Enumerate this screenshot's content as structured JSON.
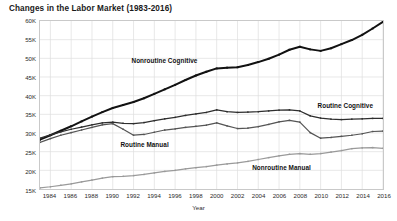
{
  "chart_data": {
    "type": "line",
    "title": "Changes in the Labor Market (1983-2016)",
    "xlabel": "Year",
    "ylabel": "Employment (Thousands)",
    "xlim": [
      1983,
      2016
    ],
    "ylim": [
      15000,
      60000
    ],
    "grid": true,
    "legend_position": "inline-annotations",
    "y_tick_labels": [
      "60K",
      "55K",
      "50K",
      "45K",
      "40K",
      "35K",
      "30K",
      "25K",
      "20K",
      "15K"
    ],
    "y_tick_values": [
      60000,
      55000,
      50000,
      45000,
      40000,
      35000,
      30000,
      25000,
      20000,
      15000
    ],
    "x_tick_labels": [
      "1984",
      "1986",
      "1988",
      "1990",
      "1992",
      "1994",
      "1996",
      "1998",
      "2000",
      "2002",
      "2004",
      "2006",
      "2008",
      "2010",
      "2012",
      "2014",
      "2016"
    ],
    "x_tick_values": [
      1984,
      1986,
      1988,
      1990,
      1992,
      1994,
      1996,
      1998,
      2000,
      2002,
      2004,
      2006,
      2008,
      2010,
      2012,
      2014,
      2016
    ],
    "x": [
      1983,
      1984,
      1985,
      1986,
      1987,
      1988,
      1989,
      1990,
      1991,
      1992,
      1993,
      1994,
      1995,
      1996,
      1997,
      1998,
      1999,
      2000,
      2001,
      2002,
      2003,
      2004,
      2005,
      2006,
      2007,
      2008,
      2009,
      2010,
      2011,
      2012,
      2013,
      2014,
      2015,
      2016
    ],
    "series": [
      {
        "name": "Nonroutine Cognitive",
        "color": "#121212",
        "values": [
          28200,
          29400,
          30600,
          31800,
          33100,
          34400,
          35600,
          36700,
          37500,
          38300,
          39300,
          40500,
          41700,
          42900,
          44200,
          45400,
          46400,
          47300,
          47500,
          47600,
          48200,
          49000,
          49900,
          51000,
          52300,
          53100,
          52400,
          52000,
          52700,
          53800,
          54900,
          56300,
          58000,
          59800
        ]
      },
      {
        "name": "Routine Cognitive",
        "color": "#2e2e2e",
        "values": [
          28600,
          29500,
          30300,
          31000,
          31600,
          32200,
          32700,
          32900,
          32600,
          32500,
          32800,
          33300,
          33800,
          34200,
          34700,
          35100,
          35500,
          36200,
          35700,
          35500,
          35600,
          35700,
          35900,
          36100,
          36200,
          35900,
          34600,
          34000,
          33700,
          33600,
          33700,
          33800,
          33900,
          33900
        ]
      },
      {
        "name": "Routine Manual",
        "color": "#555555",
        "values": [
          27500,
          28500,
          29400,
          30100,
          30800,
          31500,
          32200,
          32500,
          31000,
          29400,
          29600,
          30200,
          30800,
          31100,
          31500,
          31800,
          32100,
          32700,
          31900,
          31200,
          31300,
          31700,
          32300,
          33000,
          33400,
          32900,
          30100,
          28600,
          28800,
          29100,
          29400,
          29800,
          30400,
          30500
        ]
      },
      {
        "name": "Nonroutine Manual",
        "color": "#9a9a9a",
        "values": [
          15300,
          15600,
          16000,
          16400,
          16900,
          17400,
          17900,
          18300,
          18400,
          18600,
          18900,
          19300,
          19700,
          20000,
          20400,
          20700,
          21000,
          21400,
          21700,
          22000,
          22400,
          22900,
          23400,
          23900,
          24300,
          24500,
          24300,
          24500,
          24900,
          25300,
          25800,
          26000,
          26100,
          25900
        ]
      }
    ],
    "annotations": [
      {
        "label": "Nonroutine Cognitive",
        "x": 1995.0,
        "y": 49500
      },
      {
        "label": "Routine Cognitive",
        "x": 2012.3,
        "y": 37600
      },
      {
        "label": "Routine Manual",
        "x": 1993.1,
        "y": 27200
      },
      {
        "label": "Nonroutine Manual",
        "x": 2006.2,
        "y": 21200
      }
    ]
  }
}
